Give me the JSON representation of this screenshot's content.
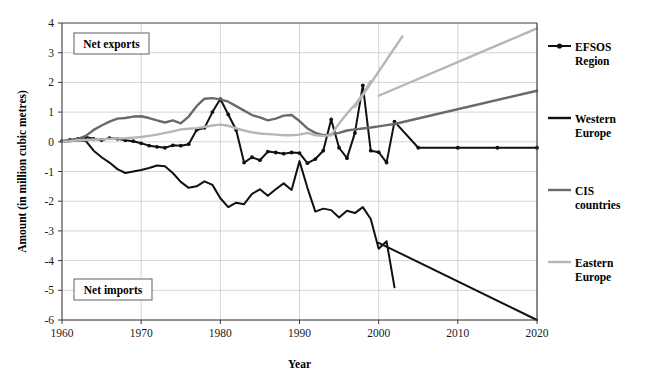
{
  "chart_data": {
    "type": "line",
    "title": "",
    "subtitle": "",
    "xlabel": "Year",
    "ylabel": "Amount (in million cubic metres)",
    "xlim": [
      1960,
      2020
    ],
    "ylim": [
      -6,
      4
    ],
    "xticks": [
      1960,
      1970,
      1980,
      1990,
      2000,
      2010,
      2020
    ],
    "yticks": [
      4,
      3,
      2,
      1,
      0,
      -1,
      -2,
      -3,
      -4,
      -5,
      -6
    ],
    "grid": true,
    "legend_position": "right",
    "annotations": [
      {
        "text": "Net exports",
        "x": 1963,
        "y": 3.0,
        "name": "net-exports-label"
      },
      {
        "text": "Net imports",
        "x": 1963,
        "y": -4.95,
        "name": "net-imports-label"
      }
    ],
    "series": [
      {
        "name": "EFSOS Region",
        "color": "#111111",
        "width": 2.0,
        "markers": true,
        "x": [
          1960,
          1961,
          1962,
          1963,
          1964,
          1965,
          1966,
          1967,
          1968,
          1969,
          1970,
          1971,
          1972,
          1973,
          1974,
          1975,
          1976,
          1977,
          1978,
          1979,
          1980,
          1981,
          1982,
          1983,
          1984,
          1985,
          1986,
          1987,
          1988,
          1989,
          1990,
          1991,
          1992,
          1993,
          1994,
          1995,
          1996,
          1997,
          1998,
          1999,
          2000,
          2001,
          2002,
          2005,
          2010,
          2015,
          2020
        ],
        "y": [
          0.02,
          0.06,
          0.1,
          0.16,
          0.1,
          0.06,
          0.12,
          0.1,
          0.05,
          0.02,
          -0.05,
          -0.13,
          -0.17,
          -0.2,
          -0.12,
          -0.13,
          -0.08,
          0.4,
          0.47,
          1.0,
          1.44,
          0.92,
          0.4,
          -0.7,
          -0.52,
          -0.62,
          -0.33,
          -0.36,
          -0.4,
          -0.36,
          -0.38,
          -0.72,
          -0.58,
          -0.3,
          0.75,
          -0.2,
          -0.55,
          0.3,
          1.9,
          -0.3,
          -0.35,
          -0.7,
          0.68,
          -0.2,
          -0.2,
          -0.2,
          -0.2
        ]
      },
      {
        "name": "Western Europe",
        "color": "#111111",
        "width": 2.0,
        "markers": false,
        "x": [
          1960,
          1961,
          1962,
          1963,
          1964,
          1965,
          1966,
          1967,
          1968,
          1969,
          1970,
          1971,
          1972,
          1973,
          1974,
          1975,
          1976,
          1977,
          1978,
          1979,
          1980,
          1981,
          1982,
          1983,
          1984,
          1985,
          1986,
          1987,
          1988,
          1989,
          1990,
          1991,
          1992,
          1993,
          1994,
          1995,
          1996,
          1997,
          1998,
          1999,
          2000,
          2001,
          2002
        ],
        "y": [
          0.0,
          0.02,
          0.05,
          0.03,
          -0.3,
          -0.52,
          -0.7,
          -0.92,
          -1.05,
          -1.0,
          -0.95,
          -0.88,
          -0.8,
          -0.82,
          -1.05,
          -1.35,
          -1.55,
          -1.5,
          -1.33,
          -1.45,
          -1.9,
          -2.2,
          -2.05,
          -2.1,
          -1.75,
          -1.6,
          -1.82,
          -1.6,
          -1.4,
          -1.62,
          -0.65,
          -1.55,
          -2.35,
          -2.25,
          -2.3,
          -2.55,
          -2.32,
          -2.4,
          -2.2,
          -2.6,
          -3.6,
          -3.35,
          -4.9
        ]
      },
      {
        "name": "Western Europe (projection)",
        "color": "#111111",
        "width": 2.0,
        "markers": false,
        "projection": true,
        "x": [
          2000,
          2020
        ],
        "y": [
          -3.4,
          -6.0
        ]
      },
      {
        "name": "CIS countries",
        "color": "#6a6a6a",
        "width": 2.4,
        "markers": false,
        "x": [
          1960,
          1961,
          1962,
          1963,
          1964,
          1965,
          1966,
          1967,
          1968,
          1969,
          1970,
          1971,
          1972,
          1973,
          1974,
          1975,
          1976,
          1977,
          1978,
          1979,
          1980,
          1981,
          1982,
          1983,
          1984,
          1985,
          1986,
          1987,
          1988,
          1989,
          1990,
          1991,
          1992,
          1993,
          1994,
          1995,
          1996,
          1997,
          1998,
          1999,
          2000,
          2001,
          2002
        ],
        "y": [
          0.02,
          0.05,
          0.1,
          0.2,
          0.4,
          0.55,
          0.68,
          0.78,
          0.8,
          0.85,
          0.86,
          0.8,
          0.72,
          0.65,
          0.72,
          0.62,
          0.85,
          1.2,
          1.45,
          1.47,
          1.43,
          1.35,
          1.2,
          1.05,
          0.9,
          0.82,
          0.72,
          0.78,
          0.88,
          0.9,
          0.7,
          0.45,
          0.3,
          0.22,
          0.25,
          0.3,
          0.38,
          0.42,
          0.45,
          0.48,
          0.52,
          0.56,
          0.6
        ]
      },
      {
        "name": "CIS countries (projection)",
        "color": "#6a6a6a",
        "width": 2.4,
        "markers": false,
        "projection": true,
        "x": [
          2002,
          2020
        ],
        "y": [
          0.6,
          1.72
        ]
      },
      {
        "name": "Eastern Europe",
        "color": "#b6b6b6",
        "width": 2.4,
        "markers": false,
        "x": [
          1960,
          1961,
          1962,
          1963,
          1964,
          1965,
          1966,
          1967,
          1968,
          1969,
          1970,
          1971,
          1972,
          1973,
          1974,
          1975,
          1976,
          1977,
          1978,
          1979,
          1980,
          1981,
          1982,
          1983,
          1984,
          1985,
          1986,
          1987,
          1988,
          1989,
          1990,
          1991,
          1992,
          1993,
          1994,
          1995,
          1996,
          1997,
          1998,
          1999
        ],
        "y": [
          0.0,
          0.02,
          0.05,
          0.06,
          0.08,
          0.08,
          0.1,
          0.11,
          0.12,
          0.14,
          0.16,
          0.2,
          0.24,
          0.3,
          0.35,
          0.42,
          0.44,
          0.46,
          0.5,
          0.55,
          0.58,
          0.54,
          0.45,
          0.38,
          0.32,
          0.28,
          0.26,
          0.24,
          0.22,
          0.22,
          0.24,
          0.3,
          0.22,
          0.2,
          0.22,
          0.62,
          0.95,
          1.25,
          1.6,
          2.05
        ]
      },
      {
        "name": "Eastern Europe (projection)",
        "color": "#b6b6b6",
        "width": 2.4,
        "markers": false,
        "projection": true,
        "x": [
          1997,
          2003
        ],
        "y": [
          1.18,
          3.55
        ]
      },
      {
        "name": "Eastern Europe (trend)",
        "color": "#b6b6b6",
        "width": 2.4,
        "markers": false,
        "projection": true,
        "x": [
          2000,
          2020
        ],
        "y": [
          1.55,
          3.82
        ]
      }
    ],
    "legend": [
      {
        "label_line1": "EFSOS",
        "label_line2": "Region",
        "color": "#111111",
        "marker": true
      },
      {
        "label_line1": "Western",
        "label_line2": "Europe",
        "color": "#111111",
        "marker": false
      },
      {
        "label_line1": "CIS",
        "label_line2": "countries",
        "color": "#6a6a6a",
        "marker": false
      },
      {
        "label_line1": "Eastern",
        "label_line2": "Europe",
        "color": "#b6b6b6",
        "marker": false
      }
    ]
  },
  "axes": {
    "x_title": "Year",
    "y_title": "Amount (in million cubic metres)"
  },
  "annotations": {
    "net_exports": "Net exports",
    "net_imports": "Net imports"
  },
  "legend": {
    "item0_line1": "EFSOS",
    "item0_line2": "Region",
    "item1_line1": "Western",
    "item1_line2": "Europe",
    "item2_line1": "CIS",
    "item2_line2": "countries",
    "item3_line1": "Eastern",
    "item3_line2": "Europe"
  },
  "ticks": {
    "x": [
      "1960",
      "1970",
      "1980",
      "1990",
      "2000",
      "2010",
      "2020"
    ],
    "y": [
      "4",
      "3",
      "2",
      "1",
      "0",
      "-1",
      "-2",
      "-3",
      "-4",
      "-5",
      "-6"
    ]
  },
  "colors": {
    "efsos": "#111111",
    "western_europe": "#111111",
    "cis": "#6a6a6a",
    "eastern_europe": "#b6b6b6",
    "grid": "#c9c9c9",
    "axis": "#3a3a3a"
  }
}
